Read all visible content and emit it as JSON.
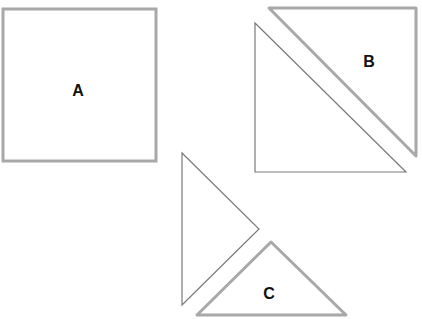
{
  "diagram": {
    "width": 422,
    "height": 319,
    "background": "#ffffff",
    "shapes": [
      {
        "id": "square-a",
        "label": "A",
        "type": "square",
        "stroke": "#a8a8a8",
        "stroke_width": 3
      },
      {
        "id": "triangle-b",
        "label": "B",
        "type": "right-triangle",
        "stroke": "#a8a8a8",
        "stroke_width": 3
      },
      {
        "id": "triangle-unlabeled-large",
        "label": "",
        "type": "right-triangle",
        "stroke": "#7a7a7a",
        "stroke_width": 1
      },
      {
        "id": "triangle-unlabeled-small",
        "label": "",
        "type": "right-triangle",
        "stroke": "#7a7a7a",
        "stroke_width": 1
      },
      {
        "id": "triangle-c",
        "label": "C",
        "type": "right-triangle",
        "stroke": "#a8a8a8",
        "stroke_width": 3
      }
    ],
    "labels": {
      "a": "A",
      "b": "B",
      "c": "C"
    }
  }
}
